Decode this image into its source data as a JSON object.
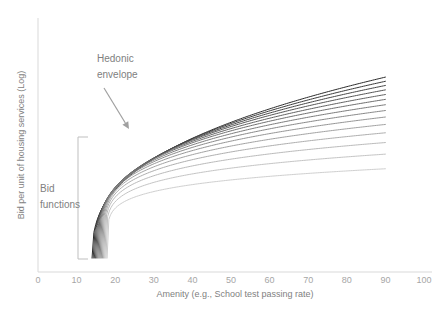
{
  "chart_data": {
    "type": "line",
    "title": "",
    "xlabel": "Amenity (e.g., School test passing rate)",
    "ylabel": "Bid per unit of housing services (Log)",
    "xlim": [
      0,
      100
    ],
    "ylim": [
      0,
      100
    ],
    "grid": false,
    "legend": "none",
    "x_ticks": [
      "0",
      "10",
      "20",
      "30",
      "40",
      "50",
      "60",
      "70",
      "80",
      "90",
      "100"
    ],
    "x_tick_values": [
      0,
      10,
      20,
      30,
      40,
      50,
      60,
      70,
      80,
      90,
      100
    ],
    "y_ticks": [],
    "annotations": [
      {
        "id": "hedonic-envelope",
        "line1": "Hedonic",
        "line2": "envelope",
        "text": "Hedonic envelope",
        "arrow_from": [
          104,
          88
        ],
        "arrow_to": [
          129,
          129
        ]
      },
      {
        "id": "bid-functions",
        "line1": "Bid",
        "line2": "functions",
        "text": "Bid functions",
        "bracket_top": [
          88,
          137
        ],
        "bracket_bottom": [
          88,
          259
        ],
        "tick": [
          78,
          198
        ]
      }
    ],
    "series_count": 14,
    "series_note": "Family of bid functions; upper envelope is the hedonic price function",
    "series": [
      {
        "name": "Bid function 1",
        "color": "#2b2b2b",
        "x0": 14.0,
        "y_end": 84.0,
        "curvature": 1.0
      },
      {
        "name": "Bid function 2",
        "color": "#3a3a3a",
        "x0": 14.3,
        "y_end": 82.2,
        "curvature": 1.06
      },
      {
        "name": "Bid function 3",
        "color": "#474747",
        "x0": 14.6,
        "y_end": 80.4,
        "curvature": 1.12
      },
      {
        "name": "Bid function 4",
        "color": "#545454",
        "x0": 14.9,
        "y_end": 78.5,
        "curvature": 1.19
      },
      {
        "name": "Bid function 5",
        "color": "#616161",
        "x0": 15.2,
        "y_end": 76.5,
        "curvature": 1.26
      },
      {
        "name": "Bid function 6",
        "color": "#6e6e6e",
        "x0": 15.5,
        "y_end": 74.4,
        "curvature": 1.34
      },
      {
        "name": "Bid function 7",
        "color": "#7b7b7b",
        "x0": 15.8,
        "y_end": 72.1,
        "curvature": 1.42
      },
      {
        "name": "Bid function 8",
        "color": "#888888",
        "x0": 16.1,
        "y_end": 69.6,
        "curvature": 1.51
      },
      {
        "name": "Bid function 9",
        "color": "#959595",
        "x0": 16.4,
        "y_end": 66.8,
        "curvature": 1.61
      },
      {
        "name": "Bid function 10",
        "color": "#a2a2a2",
        "x0": 16.7,
        "y_end": 63.6,
        "curvature": 1.72
      },
      {
        "name": "Bid function 11",
        "color": "#aeaeae",
        "x0": 17.0,
        "y_end": 60.0,
        "curvature": 1.84
      },
      {
        "name": "Bid function 12",
        "color": "#bababa",
        "x0": 17.3,
        "y_end": 55.8,
        "curvature": 1.98
      },
      {
        "name": "Bid function 13",
        "color": "#c4c4c4",
        "x0": 17.6,
        "y_end": 50.8,
        "curvature": 2.14
      },
      {
        "name": "Bid function 14",
        "color": "#cfcfcf",
        "x0": 17.9,
        "y_end": 44.5,
        "curvature": 2.33
      }
    ],
    "envelope": {
      "name": "Hedonic envelope",
      "color": "#1a1a1a",
      "description": "Upper envelope traced by the darkest curve"
    },
    "x_domain_drawn": [
      14,
      90
    ],
    "colors": {
      "axis": "#d9d9d9",
      "tick_text": "#a6a6a6",
      "axis_title": "#7f7f7f",
      "annotation": "#808080",
      "bracket": "#bfbfbf",
      "background": "#ffffff"
    }
  }
}
